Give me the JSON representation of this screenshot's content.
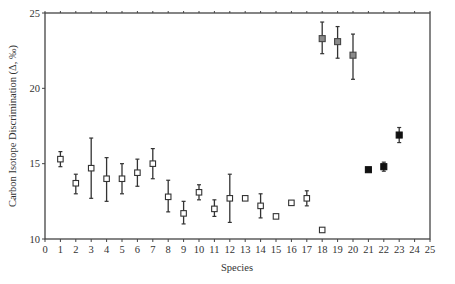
{
  "chart_data": {
    "type": "scatter",
    "title": "",
    "xlabel": "Species",
    "ylabel": "Carbon Isotope Discrimination (Δ, ‰)",
    "xlim": [
      0,
      25
    ],
    "ylim": [
      10,
      25
    ],
    "x_ticks": [
      0,
      1,
      2,
      3,
      4,
      5,
      6,
      7,
      8,
      9,
      10,
      11,
      12,
      13,
      14,
      15,
      16,
      17,
      18,
      19,
      20,
      21,
      22,
      23,
      24,
      25
    ],
    "y_ticks": [
      10,
      15,
      20,
      25
    ],
    "grid": false,
    "legend": null,
    "series": [
      {
        "name": "open squares",
        "marker": "open-square",
        "color": "#333333",
        "points": [
          {
            "x": 1,
            "y": 15.3,
            "err_hi": 15.8,
            "err_lo": 14.8
          },
          {
            "x": 2,
            "y": 13.7,
            "err_hi": 14.3,
            "err_lo": 13.0
          },
          {
            "x": 3,
            "y": 14.7,
            "err_hi": 16.7,
            "err_lo": 12.7
          },
          {
            "x": 4,
            "y": 14.0,
            "err_hi": 15.4,
            "err_lo": 12.5
          },
          {
            "x": 5,
            "y": 14.0,
            "err_hi": 15.0,
            "err_lo": 13.0
          },
          {
            "x": 6,
            "y": 14.4,
            "err_hi": 15.3,
            "err_lo": 13.5
          },
          {
            "x": 7,
            "y": 15.0,
            "err_hi": 16.0,
            "err_lo": 14.0
          },
          {
            "x": 8,
            "y": 12.8,
            "err_hi": 13.9,
            "err_lo": 11.8
          },
          {
            "x": 9,
            "y": 11.7,
            "err_hi": 12.5,
            "err_lo": 11.0
          },
          {
            "x": 10,
            "y": 13.1,
            "err_hi": 13.6,
            "err_lo": 12.6
          },
          {
            "x": 11,
            "y": 12.0,
            "err_hi": 12.6,
            "err_lo": 11.5
          },
          {
            "x": 12,
            "y": 12.7,
            "err_hi": 14.3,
            "err_lo": 11.1
          },
          {
            "x": 13,
            "y": 12.7,
            "err_hi": null,
            "err_lo": null
          },
          {
            "x": 14,
            "y": 12.2,
            "err_hi": 13.0,
            "err_lo": 11.4
          },
          {
            "x": 15,
            "y": 11.5,
            "err_hi": null,
            "err_lo": null
          },
          {
            "x": 16,
            "y": 12.4,
            "err_hi": null,
            "err_lo": null
          },
          {
            "x": 17,
            "y": 12.7,
            "err_hi": 13.2,
            "err_lo": 12.2
          },
          {
            "x": 18,
            "y": 10.6,
            "err_hi": null,
            "err_lo": null
          }
        ]
      },
      {
        "name": "grey squares",
        "marker": "grey-square",
        "color": "#777777",
        "points": [
          {
            "x": 18,
            "y": 23.3,
            "err_hi": 24.4,
            "err_lo": 22.3
          },
          {
            "x": 19,
            "y": 23.1,
            "err_hi": 24.1,
            "err_lo": 22.0
          },
          {
            "x": 20,
            "y": 22.2,
            "err_hi": 23.6,
            "err_lo": 20.6
          }
        ]
      },
      {
        "name": "filled squares",
        "marker": "filled-square",
        "color": "#111111",
        "points": [
          {
            "x": 21,
            "y": 14.6,
            "err_hi": null,
            "err_lo": null
          },
          {
            "x": 22,
            "y": 14.8,
            "err_hi": 15.1,
            "err_lo": 14.5
          },
          {
            "x": 23,
            "y": 16.9,
            "err_hi": 17.4,
            "err_lo": 16.4
          }
        ]
      }
    ]
  },
  "labels": {
    "xlabel": "Species",
    "ylabel": "Carbon Isotope Discrimination (Δ, ‰)"
  }
}
